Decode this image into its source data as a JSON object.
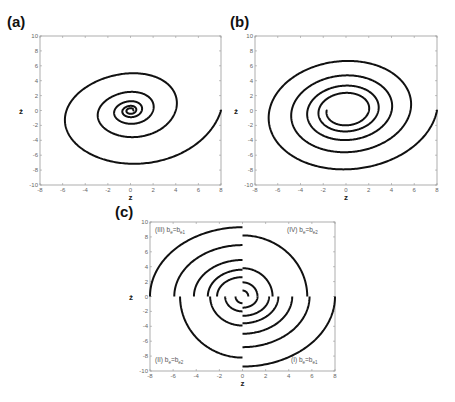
{
  "figure": {
    "panels": [
      {
        "id": "a",
        "label": "(a)"
      },
      {
        "id": "b",
        "label": "(b)"
      },
      {
        "id": "c",
        "label": "(c)"
      }
    ]
  },
  "chart_data": [
    {
      "type": "line",
      "panel": "(a)",
      "title": "",
      "xlabel": "z",
      "ylabel": "ż",
      "xlim": [
        -8,
        8
      ],
      "ylim": [
        -10,
        10
      ],
      "xticks": [
        -8,
        -6,
        -4,
        -2,
        0,
        2,
        4,
        6,
        8
      ],
      "yticks": [
        -10,
        -8,
        -6,
        -4,
        -2,
        0,
        2,
        4,
        6,
        8,
        10
      ],
      "grid": false,
      "description": "Inward (decaying) spiral phase trajectory starting at (8,0), converging to origin",
      "series": [
        {
          "name": "trajectory",
          "start": [
            8,
            0
          ],
          "end": [
            0,
            0
          ],
          "turns": 5,
          "decay_per_turn": 0.5,
          "approx_extrema": {
            "first_min_y": -8.5,
            "first_min_x": 1.6,
            "leftmost_x": -5.5,
            "top_y": 5.8,
            "second_right_x": 3.7,
            "second_min_y": -3.9,
            "second_left_x": -2.5,
            "second_top_y": 2.7
          }
        }
      ]
    },
    {
      "type": "line",
      "panel": "(b)",
      "title": "",
      "xlabel": "z",
      "ylabel": "ż",
      "xlim": [
        -8,
        8
      ],
      "ylim": [
        -10,
        10
      ],
      "xticks": [
        -8,
        -6,
        -4,
        -2,
        0,
        2,
        4,
        6,
        8
      ],
      "yticks": [
        -10,
        -8,
        -6,
        -4,
        -2,
        0,
        2,
        4,
        6,
        8,
        10
      ],
      "grid": false,
      "description": "Slowly decaying spiral trajectory from (8,0) ending near (1.7,0)",
      "series": [
        {
          "name": "trajectory",
          "start": [
            8,
            0
          ],
          "end": [
            1.7,
            0.2
          ],
          "turns": 4.5,
          "approx_extrema": {
            "min_y": [
              -9.3,
              -6.7,
              -4.9,
              -3.6,
              -2.6
            ],
            "max_y": [
              8.0,
              5.8,
              4.2,
              3.0,
              2.2
            ],
            "left_x": [
              -6.8,
              -5.0,
              -3.7,
              -2.7,
              -2.0
            ]
          }
        }
      ]
    },
    {
      "type": "line",
      "panel": "(c)",
      "title": "",
      "xlabel": "z",
      "ylabel": "ż",
      "xlim": [
        -8,
        8
      ],
      "ylim": [
        -10,
        10
      ],
      "xticks": [
        -8,
        -6,
        -4,
        -2,
        0,
        2,
        4,
        6,
        8
      ],
      "yticks": [
        -10,
        -8,
        -6,
        -4,
        -2,
        0,
        2,
        4,
        6,
        8,
        10
      ],
      "grid": false,
      "description": "Piecewise quadrant arcs of a spiral with switching damping b_e in each quadrant",
      "annotations": [
        {
          "text": "(III) b",
          "sub1": "e",
          "mid": "=b",
          "sub2": "e1",
          "quadrant": "top-left"
        },
        {
          "text": "(IV) b",
          "sub1": "e",
          "mid": "=b",
          "sub2": "e2",
          "quadrant": "top-right"
        },
        {
          "text": "(II) b",
          "sub1": "e",
          "mid": "=b",
          "sub2": "e2",
          "quadrant": "bottom-left"
        },
        {
          "text": "(I) b",
          "sub1": "e",
          "mid": "=b",
          "sub2": "e1",
          "quadrant": "bottom-right"
        }
      ],
      "series": [
        {
          "name": "quadrant I arcs (x>0,y<0)",
          "outer_radii_x": [
            8,
            5.8,
            4.3,
            3.1,
            2.3,
            1.3
          ],
          "min_y": [
            -9.4,
            -6.8,
            -5.0,
            -3.6,
            -2.6,
            -1.5
          ]
        },
        {
          "name": "quadrant II arcs (x<0,y<0)",
          "left_x": [
            -5.4,
            -2.8,
            -1.5,
            -0.6
          ],
          "min_y": [
            -8.2,
            -3.9,
            -2.0,
            -0.9
          ]
        },
        {
          "name": "quadrant III arcs (x<0,y>0)",
          "left_x": [
            -8,
            -5.9,
            -4.2,
            -3.0,
            -2.2
          ],
          "max_y": [
            9.3,
            6.9,
            4.9,
            3.6,
            2.6
          ]
        },
        {
          "name": "quadrant IV arcs (x>0,y>0)",
          "right_x": [
            5.6,
            2.6,
            1.3,
            0.5
          ],
          "max_y": [
            8.2,
            3.8,
            1.9,
            0.8
          ]
        }
      ]
    }
  ]
}
